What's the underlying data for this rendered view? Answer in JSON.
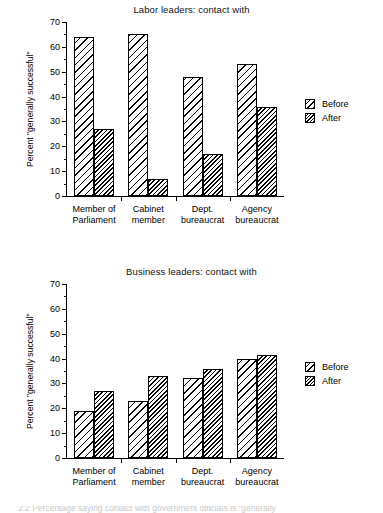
{
  "figure": {
    "caption_partial": "2.2 Percentage saying contact with government officials is “generally"
  },
  "legend": {
    "before_label": "Before",
    "after_label": "After"
  },
  "charts": [
    {
      "id": "labor-leaders",
      "title": "Labor leaders:  contact with",
      "ylabel": "Percent \"generally successful\""
    },
    {
      "id": "business-leaders",
      "title": "Business leaders:  contact with",
      "ylabel": "Percent \"generally successful\""
    }
  ],
  "chart_data": [
    {
      "type": "bar",
      "id": "labor-leaders",
      "title": "Labor leaders:  contact with",
      "xlabel": "",
      "ylabel": "Percent \"generally successful\"",
      "ylim": [
        0,
        70
      ],
      "ytick_step": 10,
      "yticks": [
        0,
        10,
        20,
        30,
        40,
        50,
        60,
        70
      ],
      "ytick_labels": [
        "0",
        "10",
        "20",
        "30",
        "40",
        "50",
        "60",
        "70"
      ],
      "minor_ticks": true,
      "grid": false,
      "legend_position": "right",
      "categories": [
        "Member of\nParliament",
        "Cabinet\nmember",
        "Dept.\nbureaucrat",
        "Agency\nbureaucrat"
      ],
      "category_lines": [
        [
          "Member of",
          "Parliament"
        ],
        [
          "Cabinet",
          "member"
        ],
        [
          "Dept.",
          "bureaucrat"
        ],
        [
          "Agency",
          "bureaucrat"
        ]
      ],
      "series": [
        {
          "name": "Before",
          "values": [
            64,
            65,
            48,
            53
          ]
        },
        {
          "name": "After",
          "values": [
            27,
            7,
            17,
            36
          ]
        }
      ]
    },
    {
      "type": "bar",
      "id": "business-leaders",
      "title": "Business leaders:  contact with",
      "xlabel": "",
      "ylabel": "Percent \"generally successful\"",
      "ylim": [
        0,
        70
      ],
      "ytick_step": 10,
      "yticks": [
        0,
        10,
        20,
        30,
        40,
        50,
        60,
        70
      ],
      "ytick_labels": [
        "0",
        "10",
        "20",
        "30",
        "40",
        "50",
        "60",
        "70"
      ],
      "minor_ticks": true,
      "grid": false,
      "legend_position": "right",
      "categories": [
        "Member of\nParliament",
        "Cabinet\nmember",
        "Dept.\nbureaucrat",
        "Agency\nbureaucrat"
      ],
      "category_lines": [
        [
          "Member of",
          "Parliament"
        ],
        [
          "Cabinet",
          "member"
        ],
        [
          "Dept.",
          "bureaucrat"
        ],
        [
          "Agency",
          "bureaucrat"
        ]
      ],
      "series": [
        {
          "name": "Before",
          "values": [
            19,
            23,
            32,
            40
          ]
        },
        {
          "name": "After",
          "values": [
            27,
            33,
            36,
            41.5
          ]
        }
      ]
    }
  ]
}
